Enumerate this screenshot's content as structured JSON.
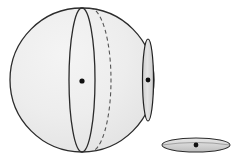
{
  "figure": {
    "type": "geometry-diagram",
    "canvas": {
      "width": 238,
      "height": 162,
      "background": "#ffffff"
    },
    "palette": {
      "sphere_fill": "#ececec",
      "sphere_stroke": "#2b2b2b",
      "disc_fill": "#d9d9d9",
      "disc_stroke": "#2b2b2b",
      "lens_fill": "#dcdcdc",
      "lens_stroke": "#222222",
      "dashed_stroke": "#555555",
      "point_fill": "#111111"
    },
    "shapes": {
      "sphere": {
        "label": "sphere-outline",
        "cx": 82,
        "cy": 80,
        "r": 72,
        "stroke_width": 1.3
      },
      "great_circle_front": {
        "label": "great-circle-front-arc",
        "cx": 82,
        "cy": 80,
        "rx": 13,
        "ry": 72,
        "stroke_width": 1.3,
        "style": "solid"
      },
      "great_circle_back": {
        "label": "great-circle-back-arc",
        "cx": 90,
        "cy": 80,
        "rx": 21,
        "ry": 72,
        "stroke_width": 1.1,
        "style": "dashed",
        "dash_pattern": "4 3"
      },
      "small_circle_lens": {
        "label": "small-circle-edge-on",
        "cx": 148,
        "cy": 80,
        "rx": 5.5,
        "ry": 41,
        "stroke_width": 1.2
      },
      "flat_disc": {
        "label": "detached-flat-disc",
        "cx": 196,
        "cy": 145,
        "rx": 34,
        "ry": 7,
        "stroke_width": 1.1
      }
    },
    "points": [
      {
        "name": "sphere-center-point",
        "cx": 82,
        "cy": 81,
        "r": 2.6
      },
      {
        "name": "small-circle-center-point",
        "cx": 148,
        "cy": 80,
        "r": 2.4
      },
      {
        "name": "flat-disc-center-point",
        "cx": 196,
        "cy": 145,
        "r": 2.4
      }
    ]
  }
}
